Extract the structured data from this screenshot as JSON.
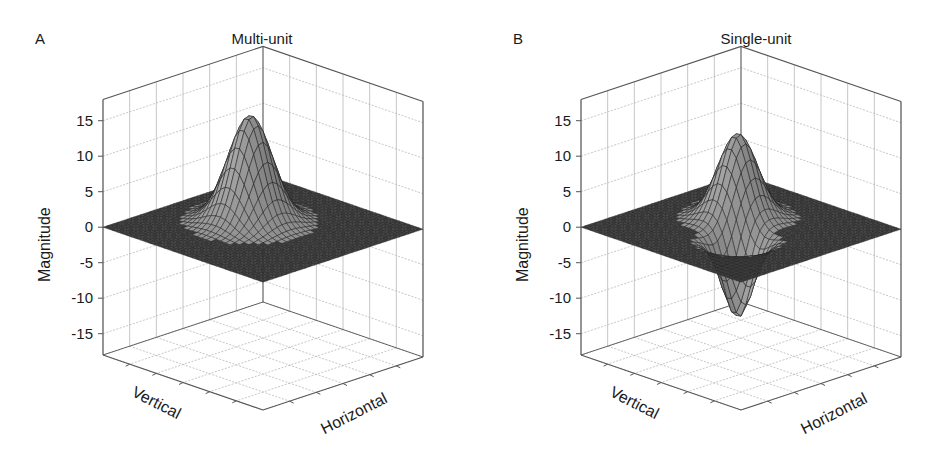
{
  "figure": {
    "panels": [
      {
        "letter": "A",
        "title": "Multi-unit",
        "offset_x": 0,
        "zlabel": "Magnitude",
        "xlabel": "Vertical",
        "ylabel": "Horizontal",
        "zticks": [
          "15",
          "10",
          "5",
          "0",
          "-5",
          "-10",
          "-15"
        ]
      },
      {
        "letter": "B",
        "title": "Single-unit",
        "offset_x": 478,
        "zlabel": "Magnitude",
        "xlabel": "Vertical",
        "ylabel": "Horizontal",
        "zticks": [
          "15",
          "10",
          "5",
          "0",
          "-5",
          "-10",
          "-15"
        ]
      }
    ]
  },
  "colors": {
    "axis": "#555555",
    "grid": "#b8b8b8",
    "surface_dark": "#3a3a3a",
    "surface_mid": "#7a7a7a",
    "surface_light": "#c4c4c4",
    "mesh": "#1e1e1e"
  },
  "chart_data": [
    {
      "type": "surface3d",
      "title": "Multi-unit",
      "panel_label": "A",
      "xlabel": "Vertical",
      "ylabel": "Horizontal",
      "zlabel": "Magnitude",
      "zlim": [
        -18,
        18
      ],
      "zticks": [
        -15,
        -10,
        -5,
        0,
        5,
        10,
        15
      ],
      "grid": true,
      "description": "Flat surface at 0 with a single positive peak near the center, max ≈ 15; no negative lobe",
      "components": [
        {
          "kind": "gaussian",
          "cx": 0.48,
          "cy": 0.4,
          "amplitude": 15,
          "sigma": 0.1
        }
      ]
    },
    {
      "type": "surface3d",
      "title": "Single-unit",
      "panel_label": "B",
      "xlabel": "Vertical",
      "ylabel": "Horizontal",
      "zlabel": "Magnitude",
      "zlim": [
        -18,
        18
      ],
      "zticks": [
        -15,
        -10,
        -5,
        0,
        5,
        10,
        15
      ],
      "grid": true,
      "description": "Flat surface at 0 with a positive peak (max ≈ 12) adjacent to a negative trough (min ≈ -11) toward the front",
      "components": [
        {
          "kind": "gaussian",
          "cx": 0.42,
          "cy": 0.4,
          "amplitude": 12,
          "sigma": 0.09
        },
        {
          "kind": "gaussian",
          "cx": 0.62,
          "cy": 0.6,
          "amplitude": -11,
          "sigma": 0.07
        }
      ]
    }
  ]
}
